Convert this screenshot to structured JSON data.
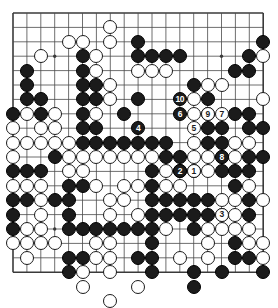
{
  "app": {
    "title": "Go board diagram",
    "board_size": 19,
    "colors": {
      "background": "#ffffff",
      "grid_line": "#4a4a4a",
      "border_line": "#3a3a3a",
      "black_stone": "#1b1b1b",
      "white_stone": "#ffffff",
      "white_stone_border": "#1b1b1b",
      "label_on_black": "#ffffff",
      "label_on_white": "#1b1b1b"
    },
    "geometry": {
      "left": 13,
      "top": 13,
      "right": 263,
      "bottom": 272,
      "col_step": 13.9,
      "row_step": 14.4,
      "stone_radius": 7.0
    }
  },
  "board": {
    "star_points": [
      {
        "col": 4,
        "row": 4
      },
      {
        "col": 10,
        "row": 4
      },
      {
        "col": 16,
        "row": 4
      },
      {
        "col": 4,
        "row": 10
      },
      {
        "col": 10,
        "row": 10
      },
      {
        "col": 16,
        "row": 10
      },
      {
        "col": 4,
        "row": 16
      },
      {
        "col": 10,
        "row": 16
      },
      {
        "col": 16,
        "row": 16
      }
    ],
    "stones": [
      {
        "col": 8,
        "row": 2,
        "color": "white"
      },
      {
        "col": 5,
        "row": 3,
        "color": "white"
      },
      {
        "col": 6,
        "row": 3,
        "color": "white"
      },
      {
        "col": 8,
        "row": 3,
        "color": "white"
      },
      {
        "col": 10,
        "row": 3,
        "color": "black"
      },
      {
        "col": 19,
        "row": 3,
        "color": "black"
      },
      {
        "col": 3,
        "row": 4,
        "color": "white"
      },
      {
        "col": 6,
        "row": 4,
        "color": "black"
      },
      {
        "col": 7,
        "row": 4,
        "color": "white"
      },
      {
        "col": 10,
        "row": 4,
        "color": "black"
      },
      {
        "col": 11,
        "row": 4,
        "color": "black"
      },
      {
        "col": 12,
        "row": 4,
        "color": "black"
      },
      {
        "col": 13,
        "row": 4,
        "color": "black"
      },
      {
        "col": 18,
        "row": 4,
        "color": "black"
      },
      {
        "col": 19,
        "row": 4,
        "color": "white"
      },
      {
        "col": 2,
        "row": 5,
        "color": "black"
      },
      {
        "col": 6,
        "row": 5,
        "color": "black"
      },
      {
        "col": 7,
        "row": 5,
        "color": "white"
      },
      {
        "col": 10,
        "row": 5,
        "color": "white"
      },
      {
        "col": 11,
        "row": 5,
        "color": "white"
      },
      {
        "col": 12,
        "row": 5,
        "color": "white"
      },
      {
        "col": 17,
        "row": 5,
        "color": "black"
      },
      {
        "col": 18,
        "row": 5,
        "color": "black"
      },
      {
        "col": 2,
        "row": 6,
        "color": "black"
      },
      {
        "col": 6,
        "row": 6,
        "color": "black"
      },
      {
        "col": 7,
        "row": 6,
        "color": "black"
      },
      {
        "col": 8,
        "row": 6,
        "color": "white"
      },
      {
        "col": 14,
        "row": 6,
        "color": "black"
      },
      {
        "col": 15,
        "row": 6,
        "color": "white"
      },
      {
        "col": 16,
        "row": 6,
        "color": "white"
      },
      {
        "col": 2,
        "row": 7,
        "color": "black"
      },
      {
        "col": 3,
        "row": 7,
        "color": "black"
      },
      {
        "col": 6,
        "row": 7,
        "color": "black"
      },
      {
        "col": 7,
        "row": 7,
        "color": "black"
      },
      {
        "col": 8,
        "row": 7,
        "color": "white"
      },
      {
        "col": 10,
        "row": 7,
        "color": "black"
      },
      {
        "col": 14,
        "row": 7,
        "color": "white"
      },
      {
        "col": 15,
        "row": 7,
        "color": "black"
      },
      {
        "col": 19,
        "row": 7,
        "color": "white"
      },
      {
        "col": 1,
        "row": 8,
        "color": "black"
      },
      {
        "col": 2,
        "row": 8,
        "color": "white"
      },
      {
        "col": 3,
        "row": 8,
        "color": "black"
      },
      {
        "col": 4,
        "row": 8,
        "color": "white"
      },
      {
        "col": 6,
        "row": 8,
        "color": "black"
      },
      {
        "col": 7,
        "row": 8,
        "color": "white"
      },
      {
        "col": 9,
        "row": 8,
        "color": "black"
      },
      {
        "col": 14,
        "row": 8,
        "color": "white"
      },
      {
        "col": 15,
        "row": 8,
        "color": "black"
      },
      {
        "col": 17,
        "row": 8,
        "color": "black"
      },
      {
        "col": 18,
        "row": 8,
        "color": "black"
      },
      {
        "col": 1,
        "row": 9,
        "color": "white"
      },
      {
        "col": 3,
        "row": 9,
        "color": "white"
      },
      {
        "col": 4,
        "row": 9,
        "color": "white"
      },
      {
        "col": 6,
        "row": 9,
        "color": "black"
      },
      {
        "col": 7,
        "row": 9,
        "color": "black"
      },
      {
        "col": 15,
        "row": 9,
        "color": "black"
      },
      {
        "col": 16,
        "row": 9,
        "color": "black"
      },
      {
        "col": 18,
        "row": 9,
        "color": "black"
      },
      {
        "col": 19,
        "row": 9,
        "color": "black"
      },
      {
        "col": 1,
        "row": 10,
        "color": "white"
      },
      {
        "col": 2,
        "row": 10,
        "color": "white"
      },
      {
        "col": 3,
        "row": 10,
        "color": "white"
      },
      {
        "col": 4,
        "row": 10,
        "color": "white"
      },
      {
        "col": 5,
        "row": 10,
        "color": "white"
      },
      {
        "col": 6,
        "row": 10,
        "color": "black"
      },
      {
        "col": 7,
        "row": 10,
        "color": "black"
      },
      {
        "col": 8,
        "row": 10,
        "color": "black"
      },
      {
        "col": 9,
        "row": 10,
        "color": "black"
      },
      {
        "col": 10,
        "row": 10,
        "color": "black"
      },
      {
        "col": 11,
        "row": 10,
        "color": "black"
      },
      {
        "col": 12,
        "row": 10,
        "color": "black"
      },
      {
        "col": 14,
        "row": 10,
        "color": "white"
      },
      {
        "col": 15,
        "row": 10,
        "color": "black"
      },
      {
        "col": 16,
        "row": 10,
        "color": "black"
      },
      {
        "col": 17,
        "row": 10,
        "color": "white"
      },
      {
        "col": 18,
        "row": 10,
        "color": "white"
      },
      {
        "col": 1,
        "row": 11,
        "color": "white"
      },
      {
        "col": 4,
        "row": 11,
        "color": "black"
      },
      {
        "col": 5,
        "row": 11,
        "color": "white"
      },
      {
        "col": 6,
        "row": 11,
        "color": "white"
      },
      {
        "col": 7,
        "row": 11,
        "color": "white"
      },
      {
        "col": 8,
        "row": 11,
        "color": "white"
      },
      {
        "col": 9,
        "row": 11,
        "color": "white"
      },
      {
        "col": 10,
        "row": 11,
        "color": "white"
      },
      {
        "col": 11,
        "row": 11,
        "color": "white"
      },
      {
        "col": 12,
        "row": 11,
        "color": "black"
      },
      {
        "col": 13,
        "row": 11,
        "color": "black"
      },
      {
        "col": 14,
        "row": 11,
        "color": "white"
      },
      {
        "col": 15,
        "row": 11,
        "color": "white"
      },
      {
        "col": 16,
        "row": 11,
        "color": "white"
      },
      {
        "col": 17,
        "row": 11,
        "color": "white"
      },
      {
        "col": 18,
        "row": 11,
        "color": "black"
      },
      {
        "col": 19,
        "row": 11,
        "color": "black"
      },
      {
        "col": 1,
        "row": 12,
        "color": "black"
      },
      {
        "col": 2,
        "row": 12,
        "color": "black"
      },
      {
        "col": 3,
        "row": 12,
        "color": "black"
      },
      {
        "col": 5,
        "row": 12,
        "color": "white"
      },
      {
        "col": 6,
        "row": 12,
        "color": "white"
      },
      {
        "col": 11,
        "row": 12,
        "color": "black"
      },
      {
        "col": 12,
        "row": 12,
        "color": "white"
      },
      {
        "col": 13,
        "row": 12,
        "color": "black"
      },
      {
        "col": 14,
        "row": 12,
        "color": "black"
      },
      {
        "col": 15,
        "row": 12,
        "color": "white"
      },
      {
        "col": 16,
        "row": 12,
        "color": "black"
      },
      {
        "col": 17,
        "row": 12,
        "color": "black"
      },
      {
        "col": 18,
        "row": 12,
        "color": "black"
      },
      {
        "col": 1,
        "row": 13,
        "color": "white"
      },
      {
        "col": 2,
        "row": 13,
        "color": "white"
      },
      {
        "col": 3,
        "row": 13,
        "color": "white"
      },
      {
        "col": 5,
        "row": 13,
        "color": "black"
      },
      {
        "col": 6,
        "row": 13,
        "color": "black"
      },
      {
        "col": 7,
        "row": 13,
        "color": "white"
      },
      {
        "col": 9,
        "row": 13,
        "color": "white"
      },
      {
        "col": 10,
        "row": 13,
        "color": "white"
      },
      {
        "col": 11,
        "row": 13,
        "color": "black"
      },
      {
        "col": 12,
        "row": 13,
        "color": "white"
      },
      {
        "col": 13,
        "row": 13,
        "color": "white"
      },
      {
        "col": 17,
        "row": 13,
        "color": "black"
      },
      {
        "col": 18,
        "row": 13,
        "color": "white"
      },
      {
        "col": 1,
        "row": 14,
        "color": "black"
      },
      {
        "col": 2,
        "row": 14,
        "color": "black"
      },
      {
        "col": 3,
        "row": 14,
        "color": "white"
      },
      {
        "col": 4,
        "row": 14,
        "color": "black"
      },
      {
        "col": 5,
        "row": 14,
        "color": "black"
      },
      {
        "col": 8,
        "row": 14,
        "color": "white"
      },
      {
        "col": 9,
        "row": 14,
        "color": "white"
      },
      {
        "col": 11,
        "row": 14,
        "color": "black"
      },
      {
        "col": 12,
        "row": 14,
        "color": "black"
      },
      {
        "col": 13,
        "row": 14,
        "color": "black"
      },
      {
        "col": 14,
        "row": 14,
        "color": "black"
      },
      {
        "col": 15,
        "row": 14,
        "color": "black"
      },
      {
        "col": 16,
        "row": 14,
        "color": "white"
      },
      {
        "col": 17,
        "row": 14,
        "color": "white"
      },
      {
        "col": 18,
        "row": 14,
        "color": "black"
      },
      {
        "col": 19,
        "row": 14,
        "color": "white"
      },
      {
        "col": 1,
        "row": 15,
        "color": "black"
      },
      {
        "col": 3,
        "row": 15,
        "color": "white"
      },
      {
        "col": 5,
        "row": 15,
        "color": "black"
      },
      {
        "col": 8,
        "row": 15,
        "color": "white"
      },
      {
        "col": 10,
        "row": 15,
        "color": "white"
      },
      {
        "col": 11,
        "row": 15,
        "color": "black"
      },
      {
        "col": 12,
        "row": 15,
        "color": "black"
      },
      {
        "col": 13,
        "row": 15,
        "color": "black"
      },
      {
        "col": 14,
        "row": 15,
        "color": "black"
      },
      {
        "col": 15,
        "row": 15,
        "color": "black"
      },
      {
        "col": 16,
        "row": 15,
        "color": "white"
      },
      {
        "col": 17,
        "row": 15,
        "color": "white"
      },
      {
        "col": 18,
        "row": 15,
        "color": "black"
      },
      {
        "col": 1,
        "row": 16,
        "color": "black"
      },
      {
        "col": 2,
        "row": 16,
        "color": "white"
      },
      {
        "col": 3,
        "row": 16,
        "color": "white"
      },
      {
        "col": 5,
        "row": 16,
        "color": "black"
      },
      {
        "col": 6,
        "row": 16,
        "color": "black"
      },
      {
        "col": 7,
        "row": 16,
        "color": "black"
      },
      {
        "col": 8,
        "row": 16,
        "color": "black"
      },
      {
        "col": 9,
        "row": 16,
        "color": "black"
      },
      {
        "col": 10,
        "row": 16,
        "color": "black"
      },
      {
        "col": 11,
        "row": 16,
        "color": "black"
      },
      {
        "col": 12,
        "row": 16,
        "color": "white"
      },
      {
        "col": 14,
        "row": 16,
        "color": "black"
      },
      {
        "col": 15,
        "row": 16,
        "color": "white"
      },
      {
        "col": 16,
        "row": 16,
        "color": "white"
      },
      {
        "col": 17,
        "row": 16,
        "color": "white"
      },
      {
        "col": 18,
        "row": 16,
        "color": "white"
      },
      {
        "col": 1,
        "row": 17,
        "color": "white"
      },
      {
        "col": 2,
        "row": 17,
        "color": "white"
      },
      {
        "col": 3,
        "row": 17,
        "color": "white"
      },
      {
        "col": 4,
        "row": 17,
        "color": "white"
      },
      {
        "col": 7,
        "row": 17,
        "color": "white"
      },
      {
        "col": 8,
        "row": 17,
        "color": "white"
      },
      {
        "col": 11,
        "row": 17,
        "color": "black"
      },
      {
        "col": 15,
        "row": 17,
        "color": "white"
      },
      {
        "col": 17,
        "row": 17,
        "color": "black"
      },
      {
        "col": 18,
        "row": 17,
        "color": "white"
      },
      {
        "col": 19,
        "row": 17,
        "color": "white"
      },
      {
        "col": 2,
        "row": 18,
        "color": "white"
      },
      {
        "col": 5,
        "row": 18,
        "color": "black"
      },
      {
        "col": 6,
        "row": 18,
        "color": "black"
      },
      {
        "col": 7,
        "row": 18,
        "color": "white"
      },
      {
        "col": 8,
        "row": 18,
        "color": "white"
      },
      {
        "col": 10,
        "row": 18,
        "color": "black"
      },
      {
        "col": 11,
        "row": 18,
        "color": "black"
      },
      {
        "col": 13,
        "row": 18,
        "color": "white"
      },
      {
        "col": 15,
        "row": 18,
        "color": "white"
      },
      {
        "col": 17,
        "row": 18,
        "color": "black"
      },
      {
        "col": 18,
        "row": 18,
        "color": "black"
      },
      {
        "col": 19,
        "row": 18,
        "color": "white"
      },
      {
        "col": 5,
        "row": 19,
        "color": "black"
      },
      {
        "col": 6,
        "row": 19,
        "color": "white"
      },
      {
        "col": 8,
        "row": 19,
        "color": "white"
      },
      {
        "col": 11,
        "row": 19,
        "color": "black"
      },
      {
        "col": 14,
        "row": 19,
        "color": "black"
      },
      {
        "col": 16,
        "row": 19,
        "color": "black"
      },
      {
        "col": 19,
        "row": 19,
        "color": "black"
      },
      {
        "col": 6,
        "row": 20,
        "color": "white"
      },
      {
        "col": 10,
        "row": 20,
        "color": "white"
      },
      {
        "col": 14,
        "row": 20,
        "color": "black"
      },
      {
        "col": 8,
        "row": 21,
        "color": "white"
      }
    ],
    "move_markers": [
      {
        "number": "1",
        "col": 14,
        "row": 12,
        "color": "white"
      },
      {
        "number": "2",
        "col": 13,
        "row": 12,
        "color": "black"
      },
      {
        "number": "3",
        "col": 16,
        "row": 15,
        "color": "white"
      },
      {
        "number": "4",
        "col": 10,
        "row": 9,
        "color": "black"
      },
      {
        "number": "5",
        "col": 14,
        "row": 9,
        "color": "white"
      },
      {
        "number": "6",
        "col": 13,
        "row": 8,
        "color": "black"
      },
      {
        "number": "7",
        "col": 16,
        "row": 8,
        "color": "white"
      },
      {
        "number": "8",
        "col": 16,
        "row": 11,
        "color": "black"
      },
      {
        "number": "9",
        "col": 15,
        "row": 8,
        "color": "white"
      },
      {
        "number": "10",
        "col": 13,
        "row": 7,
        "color": "black"
      }
    ]
  }
}
